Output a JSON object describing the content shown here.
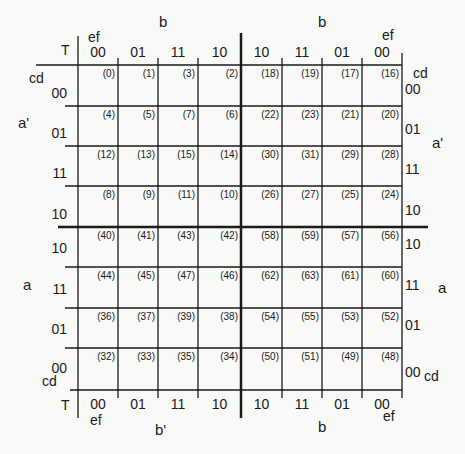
{
  "diagram": {
    "type": "karnaugh-map-6-variable",
    "corner_label": "T",
    "column_var_label": "ef",
    "row_var_label": "cd",
    "column_codes": [
      "00",
      "01",
      "11",
      "10",
      "10",
      "11",
      "01",
      "00"
    ],
    "row_codes": [
      "00",
      "01",
      "11",
      "10",
      "10",
      "11",
      "01",
      "00"
    ],
    "top_group_labels": [
      "b",
      "b"
    ],
    "bottom_group_labels": [
      "b'",
      "b"
    ],
    "left_group_labels": [
      "a'",
      "a"
    ],
    "right_group_labels": [
      "a'",
      "a"
    ],
    "cells": [
      [
        "(0)",
        "(1)",
        "(3)",
        "(2)",
        "(18)",
        "(19)",
        "(17)",
        "(16)"
      ],
      [
        "(4)",
        "(5)",
        "(7)",
        "(6)",
        "(22)",
        "(23)",
        "(21)",
        "(20)"
      ],
      [
        "(12)",
        "(13)",
        "(15)",
        "(14)",
        "(30)",
        "(31)",
        "(29)",
        "(28)"
      ],
      [
        "(8)",
        "(9)",
        "(11)",
        "(10)",
        "(26)",
        "(27)",
        "(25)",
        "(24)"
      ],
      [
        "(40)",
        "(41)",
        "(43)",
        "(42)",
        "(58)",
        "(59)",
        "(57)",
        "(56)"
      ],
      [
        "(44)",
        "(45)",
        "(47)",
        "(46)",
        "(62)",
        "(63)",
        "(61)",
        "(60)"
      ],
      [
        "(36)",
        "(37)",
        "(39)",
        "(38)",
        "(54)",
        "(55)",
        "(53)",
        "(52)"
      ],
      [
        "(32)",
        "(33)",
        "(35)",
        "(34)",
        "(50)",
        "(51)",
        "(49)",
        "(48)"
      ]
    ],
    "line_color": "#1a1a1a"
  }
}
